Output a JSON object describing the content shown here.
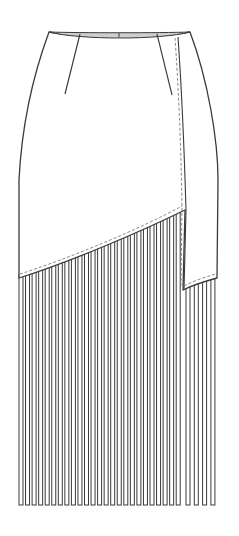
{
  "figure": {
    "view": "front",
    "colors": {
      "background": "#ffffff",
      "outline": "#3a3a3a",
      "waistband_fill": "#cfcfcf",
      "fringe_fill": "#ffffff",
      "stitch": "#7a7a7a"
    },
    "parts": {
      "waistband": {
        "label": "waistband",
        "center_tick": true
      },
      "darts": [
        {
          "label": "left dart",
          "from": [
            80,
            34
          ],
          "to": [
            65,
            94
          ]
        },
        {
          "label": "right dart",
          "from": [
            157,
            34
          ],
          "to": [
            172,
            95
          ]
        }
      ],
      "wrap_panel": {
        "label": "overlapping wrap panel",
        "topstitch": "dashed"
      },
      "upper_hem": {
        "label": "diagonal hem with topstitch",
        "from": [
          20,
          278
        ],
        "to": [
          185,
          210
        ]
      },
      "panel_hem": {
        "label": "wrap panel hem with topstitch",
        "from": [
          183,
          290
        ],
        "to": [
          217,
          278
        ]
      },
      "fringe": {
        "label": "vertical fringe strips",
        "main_count": 25,
        "panel_count": 5,
        "strip_width": 4,
        "pitch": 6.55,
        "bottom_y": 505
      }
    }
  }
}
